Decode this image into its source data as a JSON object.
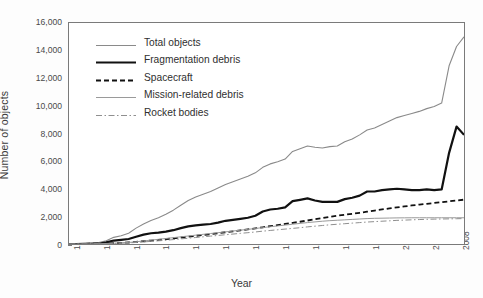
{
  "chart_data": {
    "type": "line",
    "title": "",
    "xlabel": "Year",
    "ylabel": "Number of objects",
    "xlim": [
      1956,
      2009
    ],
    "ylim": [
      0,
      16000
    ],
    "grid": false,
    "legend_position": "upper-left-inside",
    "xticks": [
      1956,
      1960,
      1964,
      1968,
      1972,
      1976,
      1980,
      1984,
      1988,
      1992,
      1996,
      2000,
      2004,
      2008
    ],
    "xtick_labels": [
      "1956",
      "1960",
      "1964",
      "1968",
      "1972",
      "1976",
      "1980",
      "1984",
      "1988",
      "1992",
      "1996",
      "2000",
      "2004",
      "2008"
    ],
    "yticks": [
      0,
      2000,
      4000,
      6000,
      8000,
      10000,
      12000,
      14000,
      16000
    ],
    "ytick_labels": [
      "0",
      "2,000",
      "4,000",
      "6,000",
      "8,000",
      "10,000",
      "12,000",
      "14,000",
      "16,000"
    ],
    "x": [
      1956,
      1957,
      1958,
      1959,
      1960,
      1961,
      1962,
      1963,
      1964,
      1965,
      1966,
      1967,
      1968,
      1969,
      1970,
      1971,
      1972,
      1973,
      1974,
      1975,
      1976,
      1977,
      1978,
      1979,
      1980,
      1981,
      1982,
      1983,
      1984,
      1985,
      1986,
      1987,
      1988,
      1989,
      1990,
      1991,
      1992,
      1993,
      1994,
      1995,
      1996,
      1997,
      1998,
      1999,
      2000,
      2001,
      2002,
      2003,
      2004,
      2005,
      2006,
      2007,
      2008,
      2009
    ],
    "series": [
      {
        "name": "Total objects",
        "style": "solid-thin-gray",
        "color": "#8a8a8a",
        "values": [
          0,
          10,
          40,
          70,
          110,
          240,
          480,
          600,
          780,
          1150,
          1450,
          1700,
          1900,
          2150,
          2450,
          2800,
          3150,
          3400,
          3600,
          3800,
          4050,
          4300,
          4500,
          4700,
          4900,
          5150,
          5550,
          5800,
          5950,
          6150,
          6700,
          6900,
          7100,
          7000,
          6950,
          7050,
          7100,
          7400,
          7600,
          7900,
          8250,
          8400,
          8650,
          8900,
          9150,
          9300,
          9450,
          9600,
          9800,
          9950,
          10200,
          12900,
          14300,
          15000
        ]
      },
      {
        "name": "Fragmentation debris",
        "style": "solid-thick-black",
        "color": "#111111",
        "values": [
          0,
          0,
          5,
          10,
          20,
          120,
          250,
          300,
          360,
          520,
          680,
          780,
          820,
          900,
          1000,
          1150,
          1280,
          1350,
          1400,
          1450,
          1550,
          1680,
          1750,
          1820,
          1900,
          2050,
          2350,
          2500,
          2550,
          2650,
          3100,
          3200,
          3300,
          3150,
          3050,
          3050,
          3050,
          3250,
          3350,
          3500,
          3800,
          3800,
          3900,
          3950,
          4000,
          3950,
          3900,
          3900,
          3950,
          3900,
          3950,
          6600,
          8500,
          7900
        ]
      },
      {
        "name": "Spacecraft",
        "style": "dashed-black",
        "color": "#111111",
        "values": [
          0,
          3,
          10,
          18,
          28,
          40,
          60,
          80,
          110,
          150,
          200,
          250,
          300,
          350,
          410,
          470,
          530,
          590,
          650,
          710,
          780,
          850,
          920,
          990,
          1060,
          1130,
          1210,
          1290,
          1370,
          1450,
          1530,
          1610,
          1700,
          1790,
          1880,
          1970,
          2050,
          2120,
          2190,
          2260,
          2340,
          2420,
          2500,
          2580,
          2650,
          2720,
          2790,
          2850,
          2910,
          2970,
          3030,
          3090,
          3150,
          3210
        ]
      },
      {
        "name": "Mission-related debris",
        "style": "solid-thin-gray2",
        "color": "#9a9a9a",
        "values": [
          0,
          2,
          6,
          12,
          20,
          35,
          55,
          80,
          110,
          160,
          220,
          280,
          340,
          400,
          460,
          520,
          580,
          640,
          700,
          760,
          820,
          880,
          940,
          1000,
          1060,
          1120,
          1190,
          1250,
          1310,
          1370,
          1430,
          1490,
          1550,
          1600,
          1650,
          1690,
          1720,
          1750,
          1780,
          1810,
          1840,
          1860,
          1870,
          1880,
          1890,
          1895,
          1900,
          1900,
          1900,
          1900,
          1900,
          1900,
          1900,
          1900
        ]
      },
      {
        "name": "Rocket bodies",
        "style": "dashdot-gray",
        "color": "#8f8f8f",
        "values": [
          0,
          2,
          5,
          10,
          16,
          26,
          40,
          58,
          80,
          110,
          150,
          190,
          230,
          270,
          320,
          370,
          420,
          470,
          520,
          570,
          620,
          670,
          720,
          770,
          820,
          870,
          930,
          980,
          1030,
          1080,
          1130,
          1180,
          1240,
          1290,
          1340,
          1390,
          1430,
          1470,
          1510,
          1550,
          1590,
          1620,
          1650,
          1680,
          1710,
          1730,
          1750,
          1770,
          1790,
          1800,
          1810,
          1820,
          1830,
          1840
        ]
      }
    ]
  },
  "legend": {
    "items": [
      {
        "label": "Total objects"
      },
      {
        "label": "Fragmentation debris"
      },
      {
        "label": "Spacecraft"
      },
      {
        "label": "Mission-related debris"
      },
      {
        "label": "Rocket bodies"
      }
    ]
  }
}
